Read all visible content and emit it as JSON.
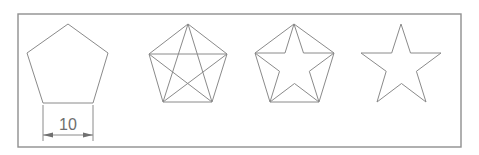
{
  "diagram": {
    "frame": {
      "x": 18,
      "y": 14,
      "width": 443,
      "height": 133
    },
    "line_color": "#8a8a8a",
    "steps": [
      {
        "name": "pentagon",
        "points": [
          [
            68,
            24
          ],
          [
            108,
            53
          ],
          [
            93,
            103
          ],
          [
            43,
            103
          ],
          [
            27,
            53
          ]
        ]
      },
      {
        "name": "pentagon-with-diagonals",
        "points": [
          [
            188,
            24
          ],
          [
            227,
            54
          ],
          [
            212,
            102
          ],
          [
            163,
            102
          ],
          [
            149,
            54
          ]
        ]
      },
      {
        "name": "star-inside-pentagon",
        "points": [
          [
            294,
            24
          ],
          [
            334,
            53
          ],
          [
            319,
            102
          ],
          [
            270,
            102
          ],
          [
            255,
            53
          ]
        ]
      },
      {
        "name": "star",
        "points": [
          [
            401,
            24
          ],
          [
            441,
            53
          ],
          [
            426,
            102
          ],
          [
            377,
            102
          ],
          [
            361,
            53
          ]
        ]
      }
    ],
    "dimension": {
      "label": "10",
      "x1": 43,
      "x2": 93,
      "line_y": 135,
      "ext_top": 105,
      "ext_bottom": 141
    }
  }
}
